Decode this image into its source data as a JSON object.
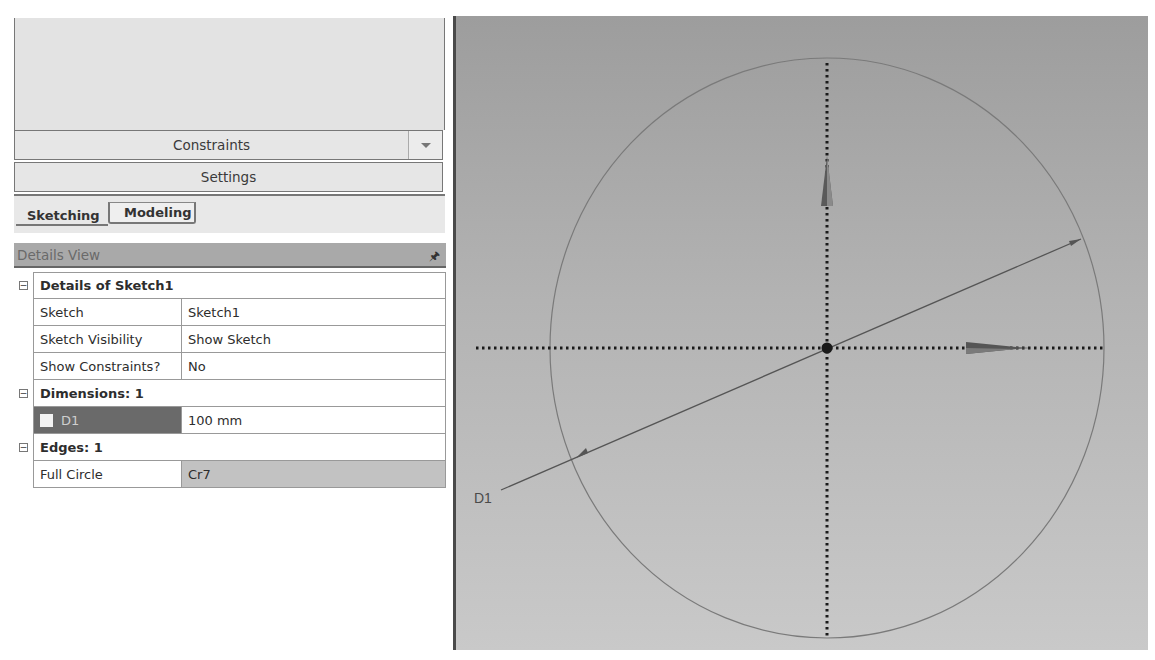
{
  "left_panel": {
    "toolbox": {
      "constraints_label": "Constraints",
      "settings_label": "Settings"
    },
    "tabs": [
      {
        "label": "Sketching",
        "active": true
      },
      {
        "label": "Modeling",
        "active": false
      }
    ],
    "details_view": {
      "title": "Details View",
      "pin_icon": "pin-icon",
      "sections": [
        {
          "title": "Details of Sketch1",
          "rows": [
            {
              "name": "Sketch",
              "value": "Sketch1"
            },
            {
              "name": "Sketch Visibility",
              "value": "Show Sketch"
            },
            {
              "name": "Show Constraints?",
              "value": "No"
            }
          ]
        },
        {
          "title": "Dimensions: 1",
          "rows": [
            {
              "name": "D1",
              "value": "100 mm",
              "selected": true
            }
          ]
        },
        {
          "title": "Edges: 1",
          "rows": [
            {
              "name": "Full Circle",
              "value": "Cr7",
              "readonly": true
            }
          ]
        }
      ]
    }
  },
  "viewport": {
    "dimension_label": "D1",
    "colors": {
      "bg_top": "#9d9d9d",
      "bg_bottom": "#c9c9c9",
      "axis": "#1a1a1a",
      "geometry": "#6e6e6e"
    }
  }
}
